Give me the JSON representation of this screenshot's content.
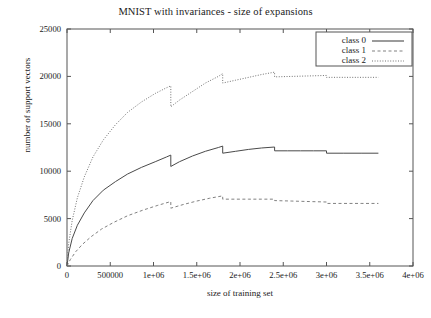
{
  "chart_data": {
    "type": "line",
    "title": "MNIST with invariances - size of expansions",
    "xlabel": "size of training set",
    "ylabel": "number of support vectors",
    "xlim": [
      0,
      4000000
    ],
    "ylim": [
      0,
      25000
    ],
    "grid": false,
    "legend_position": "top-right",
    "xticks": [
      0,
      500000,
      1000000,
      1500000,
      2000000,
      2500000,
      3000000,
      3500000,
      4000000
    ],
    "xticklabels": [
      "0",
      "500000",
      "1e+06",
      "1.5e+06",
      "2e+06",
      "2.5e+06",
      "3e+06",
      "3.5e+06",
      "4e+06"
    ],
    "yticks": [
      0,
      5000,
      10000,
      15000,
      20000,
      25000
    ],
    "yticklabels": [
      "0",
      "5000",
      "10000",
      "15000",
      "20000",
      "25000"
    ],
    "series": [
      {
        "name": "class 0",
        "style": "solid",
        "color": "#4a4a4a",
        "points": [
          [
            0,
            0
          ],
          [
            20000,
            1400
          ],
          [
            60000,
            2900
          ],
          [
            120000,
            4300
          ],
          [
            200000,
            5600
          ],
          [
            300000,
            6900
          ],
          [
            420000,
            8000
          ],
          [
            560000,
            8900
          ],
          [
            700000,
            9700
          ],
          [
            860000,
            10400
          ],
          [
            1020000,
            11000
          ],
          [
            1150000,
            11500
          ],
          [
            1200000,
            11700
          ],
          [
            1200000,
            10500
          ],
          [
            1300000,
            11000
          ],
          [
            1450000,
            11600
          ],
          [
            1600000,
            12100
          ],
          [
            1750000,
            12500
          ],
          [
            1800000,
            12650
          ],
          [
            1800000,
            11900
          ],
          [
            1950000,
            12100
          ],
          [
            2100000,
            12300
          ],
          [
            2250000,
            12450
          ],
          [
            2400000,
            12550
          ],
          [
            2400000,
            12150
          ],
          [
            2550000,
            12150
          ],
          [
            2700000,
            12150
          ],
          [
            2850000,
            12150
          ],
          [
            3000000,
            12150
          ],
          [
            3000000,
            11900
          ],
          [
            3200000,
            11900
          ],
          [
            3400000,
            11900
          ],
          [
            3600000,
            11900
          ]
        ]
      },
      {
        "name": "class 1",
        "style": "dashed",
        "color": "#7a7a7a",
        "points": [
          [
            0,
            0
          ],
          [
            40000,
            700
          ],
          [
            100000,
            1500
          ],
          [
            180000,
            2300
          ],
          [
            280000,
            3100
          ],
          [
            400000,
            3900
          ],
          [
            540000,
            4600
          ],
          [
            700000,
            5300
          ],
          [
            880000,
            5900
          ],
          [
            1050000,
            6400
          ],
          [
            1200000,
            6800
          ],
          [
            1200000,
            6100
          ],
          [
            1350000,
            6500
          ],
          [
            1500000,
            6850
          ],
          [
            1650000,
            7150
          ],
          [
            1800000,
            7400
          ],
          [
            1800000,
            7050
          ],
          [
            1950000,
            7050
          ],
          [
            2100000,
            7050
          ],
          [
            2250000,
            7050
          ],
          [
            2400000,
            7050
          ],
          [
            2400000,
            6900
          ],
          [
            2600000,
            6850
          ],
          [
            2800000,
            6800
          ],
          [
            3000000,
            6750
          ],
          [
            3000000,
            6600
          ],
          [
            3200000,
            6600
          ],
          [
            3400000,
            6600
          ],
          [
            3600000,
            6600
          ]
        ]
      },
      {
        "name": "class 2",
        "style": "dotted",
        "color": "#6a6a6a",
        "points": [
          [
            0,
            0
          ],
          [
            20000,
            2400
          ],
          [
            60000,
            4800
          ],
          [
            120000,
            7200
          ],
          [
            200000,
            9400
          ],
          [
            300000,
            11500
          ],
          [
            420000,
            13300
          ],
          [
            560000,
            14900
          ],
          [
            700000,
            16200
          ],
          [
            860000,
            17300
          ],
          [
            1020000,
            18200
          ],
          [
            1150000,
            18800
          ],
          [
            1200000,
            19000
          ],
          [
            1200000,
            16800
          ],
          [
            1300000,
            17500
          ],
          [
            1450000,
            18400
          ],
          [
            1600000,
            19300
          ],
          [
            1750000,
            20000
          ],
          [
            1800000,
            20300
          ],
          [
            1800000,
            19300
          ],
          [
            1950000,
            19600
          ],
          [
            2100000,
            19900
          ],
          [
            2250000,
            20200
          ],
          [
            2400000,
            20450
          ],
          [
            2400000,
            19950
          ],
          [
            2600000,
            20000
          ],
          [
            2800000,
            20050
          ],
          [
            3000000,
            20100
          ],
          [
            3000000,
            19900
          ],
          [
            3200000,
            19900
          ],
          [
            3400000,
            19900
          ],
          [
            3600000,
            19900
          ]
        ]
      }
    ]
  },
  "legend": {
    "items": [
      {
        "label": "class 0"
      },
      {
        "label": "class 1"
      },
      {
        "label": "class 2"
      }
    ]
  }
}
